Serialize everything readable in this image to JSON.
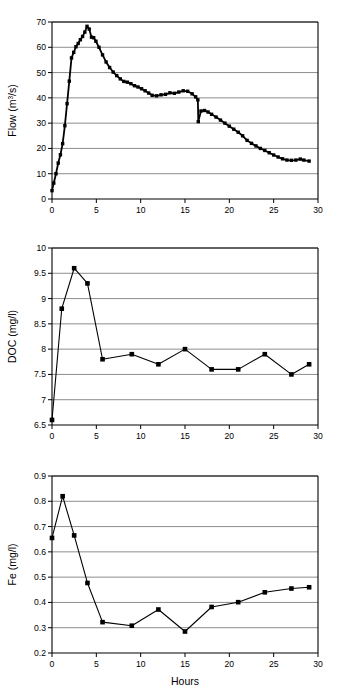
{
  "figure": {
    "clipped_caption_top": "(mg/l) and Fe (mg/l) during the storm hydrograph",
    "xlabel": "Hours",
    "marker_color": "#000000",
    "line_color": "#000000",
    "gridline_color": "#808080",
    "background": "#ffffff"
  },
  "chart_data": [
    {
      "type": "line",
      "id": "flow",
      "title": "",
      "xlabel": "",
      "ylabel": "Flow (m3/s)",
      "ylabel_parts": {
        "base": "Flow (m",
        "sup": "3",
        "tail": "/s)"
      },
      "xlim": [
        0,
        30
      ],
      "ylim": [
        0,
        70
      ],
      "xticks": [
        0,
        5,
        10,
        15,
        20,
        25,
        30
      ],
      "yticks": [
        0,
        10,
        20,
        30,
        40,
        50,
        60,
        70
      ],
      "xtick_labels": [
        "0",
        "5",
        "10",
        "15",
        "20",
        "25",
        "30"
      ],
      "ytick_labels": [
        "0",
        "10",
        "20",
        "30",
        "40",
        "50",
        "60",
        "70"
      ],
      "grid": "horizontal",
      "legend": "none",
      "markers": true,
      "note": "Storm hydrograph with an abrupt vertical drop near hour 16.5",
      "x": [
        0.0,
        0.2,
        0.45,
        0.7,
        0.95,
        1.2,
        1.45,
        1.7,
        1.95,
        2.2,
        2.45,
        2.7,
        2.95,
        3.2,
        3.45,
        3.7,
        3.95,
        4.2,
        4.45,
        4.7,
        4.95,
        5.3,
        5.7,
        6.1,
        6.5,
        6.9,
        7.3,
        7.7,
        8.1,
        8.5,
        8.9,
        9.3,
        9.7,
        10.1,
        10.5,
        10.9,
        11.3,
        11.8,
        12.3,
        12.8,
        13.3,
        13.8,
        14.3,
        14.8,
        15.3,
        15.8,
        16.2,
        16.45,
        16.5,
        16.8,
        17.2,
        17.6,
        18.0,
        18.5,
        19.0,
        19.5,
        20.0,
        20.5,
        21.0,
        21.5,
        22.0,
        22.5,
        23.0,
        23.5,
        24.0,
        24.5,
        25.0,
        25.5,
        26.0,
        26.5,
        27.0,
        27.5,
        28.0,
        28.4,
        29.0
      ],
      "y": [
        3.3,
        6.3,
        10.0,
        14.2,
        17.5,
        21.9,
        29.0,
        37.7,
        46.6,
        55.8,
        58.0,
        60.2,
        61.5,
        63.0,
        64.3,
        66.0,
        68.3,
        67.2,
        64.0,
        63.8,
        62.4,
        60.0,
        57.0,
        54.2,
        52.0,
        50.2,
        48.8,
        47.5,
        46.5,
        46.2,
        45.6,
        44.8,
        44.3,
        43.6,
        42.8,
        41.9,
        41.0,
        40.8,
        41.2,
        41.4,
        42.0,
        41.8,
        42.3,
        42.8,
        42.6,
        41.6,
        40.4,
        39.2,
        30.6,
        34.8,
        35.0,
        34.4,
        33.5,
        32.4,
        31.2,
        30.0,
        28.8,
        27.6,
        26.4,
        25.0,
        23.2,
        22.0,
        21.0,
        20.0,
        19.2,
        18.3,
        17.4,
        16.6,
        15.9,
        15.4,
        15.3,
        15.4,
        15.8,
        15.4,
        15.0
      ]
    },
    {
      "type": "line",
      "id": "doc",
      "title": "",
      "xlabel": "",
      "ylabel": "DOC (mg/l)",
      "xlim": [
        0,
        30
      ],
      "ylim": [
        6.5,
        10
      ],
      "xticks": [
        0,
        5,
        10,
        15,
        20,
        25,
        30
      ],
      "yticks": [
        6.5,
        7,
        7.5,
        8,
        8.5,
        9,
        9.5,
        10
      ],
      "xtick_labels": [
        "0",
        "5",
        "10",
        "15",
        "20",
        "25",
        "30"
      ],
      "ytick_labels": [
        "6.5",
        "7",
        "7.5",
        "8",
        "8.5",
        "9",
        "9.5",
        "10"
      ],
      "grid": "horizontal",
      "legend": "none",
      "markers": true,
      "x": [
        0.0,
        1.1,
        2.5,
        4.0,
        5.7,
        9.0,
        12.0,
        15.0,
        18.0,
        21.0,
        24.0,
        27.0,
        29.0
      ],
      "y": [
        6.6,
        8.8,
        9.6,
        9.3,
        7.8,
        7.9,
        7.7,
        8.0,
        7.6,
        7.6,
        7.9,
        7.5,
        7.7
      ]
    },
    {
      "type": "line",
      "id": "fe",
      "title": "",
      "xlabel": "Hours",
      "ylabel": "Fe (mg/l)",
      "xlim": [
        0,
        30
      ],
      "ylim": [
        0.2,
        0.9
      ],
      "xticks": [
        0,
        5,
        10,
        15,
        20,
        25,
        30
      ],
      "yticks": [
        0.2,
        0.3,
        0.4,
        0.5,
        0.6,
        0.7,
        0.8,
        0.9
      ],
      "xtick_labels": [
        "0",
        "5",
        "10",
        "15",
        "20",
        "25",
        "30"
      ],
      "ytick_labels": [
        "0.2",
        "0.3",
        "0.4",
        "0.5",
        "0.6",
        "0.7",
        "0.8",
        "0.9"
      ],
      "grid": "horizontal",
      "legend": "none",
      "markers": true,
      "x": [
        0.0,
        1.2,
        2.5,
        4.0,
        5.7,
        9.0,
        12.0,
        15.0,
        18.0,
        21.0,
        24.0,
        27.0,
        29.0
      ],
      "y": [
        0.655,
        0.82,
        0.665,
        0.477,
        0.322,
        0.308,
        0.372,
        0.285,
        0.382,
        0.401,
        0.44,
        0.455,
        0.46
      ]
    }
  ]
}
